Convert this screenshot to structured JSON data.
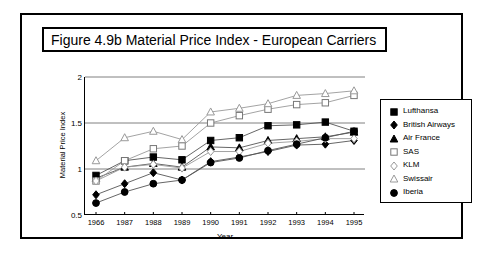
{
  "figure": {
    "title": "Figure 4.9b  Material Price Index - European Carriers"
  },
  "chart_data": {
    "type": "line",
    "title": "Figure 4.9b  Material Price Index - European Carriers",
    "xlabel": "Year",
    "ylabel": "Material Price Index",
    "categories": [
      "1966",
      "1987",
      "1988",
      "1989",
      "1990",
      "1991",
      "1992",
      "1993",
      "1994",
      "1995"
    ],
    "x_tick_labels": [
      "1966",
      "1987",
      "1988",
      "1989",
      "1990",
      "1991",
      "1992",
      "1993",
      "1994",
      "1995"
    ],
    "y_tick_labels": [
      "0.5",
      "1",
      "1.5",
      "2"
    ],
    "y_ticks": [
      0.5,
      1,
      1.5,
      2
    ],
    "ylim": [
      0.5,
      2
    ],
    "grid": "horizontal",
    "legend_position": "right-outside",
    "series": [
      {
        "name": "Lufthansa",
        "marker": "filled-square",
        "values": [
          0.93,
          1.09,
          1.13,
          1.1,
          1.31,
          1.34,
          1.47,
          1.48,
          1.51,
          1.41
        ]
      },
      {
        "name": "British Airways",
        "marker": "filled-diamond",
        "values": [
          0.72,
          0.84,
          0.96,
          0.88,
          1.08,
          1.13,
          1.19,
          1.26,
          1.27,
          1.31
        ]
      },
      {
        "name": "Air France",
        "marker": "filled-triangle",
        "values": [
          0.9,
          1.02,
          1.06,
          1.02,
          1.24,
          1.23,
          1.31,
          1.33,
          1.35,
          1.4
        ]
      },
      {
        "name": "SAS",
        "marker": "open-square",
        "values": [
          0.87,
          1.09,
          1.22,
          1.25,
          1.5,
          1.58,
          1.65,
          1.7,
          1.72,
          1.8
        ]
      },
      {
        "name": "KLM",
        "marker": "open-diamond",
        "values": [
          0.87,
          1.02,
          1.05,
          1.01,
          1.19,
          1.19,
          1.28,
          1.3,
          1.33,
          1.33
        ]
      },
      {
        "name": "Swissair",
        "marker": "open-triangle",
        "values": [
          1.09,
          1.34,
          1.41,
          1.32,
          1.62,
          1.66,
          1.71,
          1.8,
          1.82,
          1.85
        ]
      },
      {
        "name": "Iberia",
        "marker": "filled-circle",
        "values": [
          0.63,
          0.75,
          0.84,
          0.88,
          1.07,
          1.12,
          1.2,
          1.27,
          1.34,
          1.41
        ]
      }
    ]
  },
  "legend": {
    "items": [
      {
        "label": "Lufthansa",
        "marker": "filled-square"
      },
      {
        "label": "British Airways",
        "marker": "filled-diamond"
      },
      {
        "label": "Air France",
        "marker": "filled-triangle"
      },
      {
        "label": "SAS",
        "marker": "open-square"
      },
      {
        "label": "KLM",
        "marker": "open-diamond"
      },
      {
        "label": "Swissair",
        "marker": "open-triangle"
      },
      {
        "label": "Iberia",
        "marker": "filled-circle"
      }
    ]
  },
  "colors": {
    "axis": "#000000",
    "grid": "#808080",
    "filled_marker": "#000000",
    "open_marker": "#ffffff",
    "line_dark": "#555555",
    "line_light": "#999999"
  }
}
